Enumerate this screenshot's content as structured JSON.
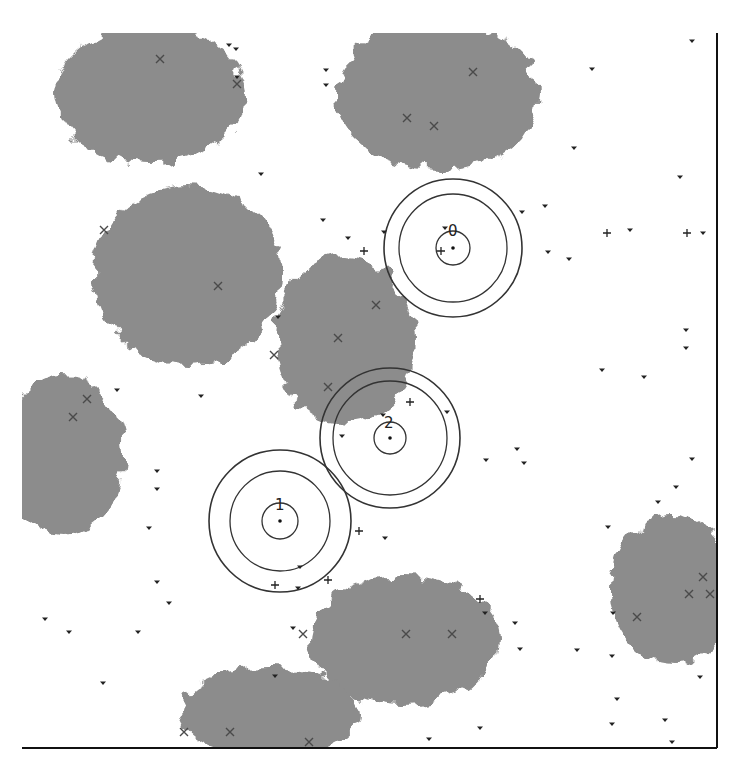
{
  "figure": {
    "type": "simulation-world-view",
    "width": 738,
    "height": 772,
    "background": "#ffffff",
    "region_color": "#8c8c8c",
    "marker_color": "#222222",
    "axis": {
      "right_line": {
        "x": 717,
        "y1": 33,
        "y2": 748
      },
      "bottom_line": {
        "y": 748,
        "x1": 22,
        "x2": 717
      }
    }
  },
  "regions": [
    {
      "name": "region-top-left",
      "cx": 150,
      "cy": 95,
      "rx": 95,
      "ry": 70,
      "clip_top": 33
    },
    {
      "name": "region-top-middle",
      "cx": 438,
      "cy": 95,
      "rx": 100,
      "ry": 75,
      "clip_top": 33
    },
    {
      "name": "region-left-middle",
      "cx": 188,
      "cy": 275,
      "rx": 95,
      "ry": 90
    },
    {
      "name": "region-center",
      "cx": 345,
      "cy": 340,
      "rx": 70,
      "ry": 85
    },
    {
      "name": "region-left-edge",
      "cx": 62,
      "cy": 455,
      "rx": 62,
      "ry": 80,
      "clip_left": 22
    },
    {
      "name": "region-bottom-center",
      "cx": 405,
      "cy": 640,
      "rx": 95,
      "ry": 65
    },
    {
      "name": "region-bottom-left",
      "cx": 270,
      "cy": 712,
      "rx": 90,
      "ry": 45,
      "clip_bottom": 748
    },
    {
      "name": "region-right",
      "cx": 672,
      "cy": 590,
      "rx": 62,
      "ry": 75,
      "clip_right": 717
    }
  ],
  "agents": [
    {
      "id": "0",
      "label": "0",
      "cx": 453,
      "cy": 248,
      "radii": [
        17,
        54,
        69
      ],
      "label_x": 448,
      "label_y": 236
    },
    {
      "id": "2",
      "label": "2",
      "cx": 390,
      "cy": 438,
      "radii": [
        16,
        57,
        70
      ],
      "label_x": 384,
      "label_y": 428
    },
    {
      "id": "1",
      "label": "1",
      "cx": 280,
      "cy": 521,
      "radii": [
        18,
        50,
        71
      ],
      "label_x": 275,
      "label_y": 510
    }
  ],
  "x_markers": [
    [
      160,
      59
    ],
    [
      237,
      84
    ],
    [
      473,
      72
    ],
    [
      407,
      118
    ],
    [
      434,
      126
    ],
    [
      104,
      230
    ],
    [
      218,
      286
    ],
    [
      338,
      338
    ],
    [
      376,
      305
    ],
    [
      328,
      387
    ],
    [
      274,
      355
    ],
    [
      87,
      399
    ],
    [
      73,
      417
    ],
    [
      303,
      634
    ],
    [
      406,
      634
    ],
    [
      452,
      634
    ],
    [
      637,
      617
    ],
    [
      703,
      577
    ],
    [
      689,
      594
    ],
    [
      710,
      594
    ],
    [
      184,
      732
    ],
    [
      230,
      732
    ],
    [
      309,
      742
    ]
  ],
  "plus_markers": [
    [
      364,
      251
    ],
    [
      607,
      233
    ],
    [
      687,
      233
    ],
    [
      441,
      251
    ],
    [
      410,
      402
    ],
    [
      359,
      531
    ],
    [
      275,
      585
    ],
    [
      328,
      580
    ],
    [
      480,
      599
    ]
  ],
  "triangle_markers": [
    [
      229,
      45
    ],
    [
      236,
      49
    ],
    [
      326,
      70
    ],
    [
      326,
      85
    ],
    [
      237,
      77
    ],
    [
      261,
      174
    ],
    [
      323,
      220
    ],
    [
      348,
      238
    ],
    [
      384,
      232
    ],
    [
      445,
      228
    ],
    [
      692,
      41
    ],
    [
      592,
      69
    ],
    [
      574,
      148
    ],
    [
      680,
      177
    ],
    [
      545,
      206
    ],
    [
      522,
      212
    ],
    [
      548,
      252
    ],
    [
      569,
      259
    ],
    [
      630,
      230
    ],
    [
      703,
      233
    ],
    [
      686,
      330
    ],
    [
      686,
      348
    ],
    [
      602,
      370
    ],
    [
      644,
      377
    ],
    [
      157,
      471
    ],
    [
      157,
      489
    ],
    [
      149,
      528
    ],
    [
      157,
      582
    ],
    [
      169,
      603
    ],
    [
      45,
      619
    ],
    [
      69,
      632
    ],
    [
      138,
      632
    ],
    [
      103,
      683
    ],
    [
      117,
      390
    ],
    [
      201,
      396
    ],
    [
      278,
      317
    ],
    [
      300,
      567
    ],
    [
      298,
      588
    ],
    [
      383,
      415
    ],
    [
      447,
      412
    ],
    [
      342,
      436
    ],
    [
      517,
      449
    ],
    [
      524,
      463
    ],
    [
      486,
      460
    ],
    [
      692,
      459
    ],
    [
      676,
      487
    ],
    [
      658,
      502
    ],
    [
      608,
      527
    ],
    [
      385,
      538
    ],
    [
      485,
      613
    ],
    [
      515,
      623
    ],
    [
      613,
      613
    ],
    [
      520,
      649
    ],
    [
      577,
      650
    ],
    [
      612,
      656
    ],
    [
      617,
      699
    ],
    [
      612,
      724
    ],
    [
      665,
      720
    ],
    [
      672,
      742
    ],
    [
      700,
      677
    ],
    [
      429,
      739
    ],
    [
      480,
      728
    ],
    [
      293,
      628
    ],
    [
      275,
      676
    ]
  ]
}
